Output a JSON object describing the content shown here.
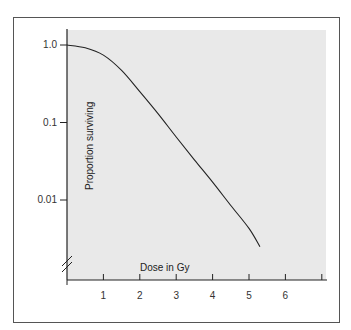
{
  "chart_data": {
    "type": "line",
    "title": "",
    "xlabel": "Dose in Gy",
    "ylabel": "Proportion surviving",
    "yscale": "log",
    "xlim": [
      0,
      7
    ],
    "ylim": [
      0.0015,
      1.3
    ],
    "x_ticks": [
      "1",
      "2",
      "3",
      "4",
      "5",
      "6",
      ""
    ],
    "y_ticks": [
      "1.0",
      "0.1",
      "0.01"
    ],
    "grid": false,
    "legend": null,
    "axis_break": "y-axis break marks near origin",
    "series": [
      {
        "name": "Cell survival curve",
        "x": [
          0,
          0.5,
          1.0,
          1.5,
          2.0,
          2.5,
          3.0,
          3.5,
          4.0,
          4.5,
          5.0,
          5.3
        ],
        "y": [
          1.0,
          0.92,
          0.74,
          0.47,
          0.25,
          0.13,
          0.065,
          0.033,
          0.017,
          0.0085,
          0.0043,
          0.0025
        ]
      }
    ]
  }
}
